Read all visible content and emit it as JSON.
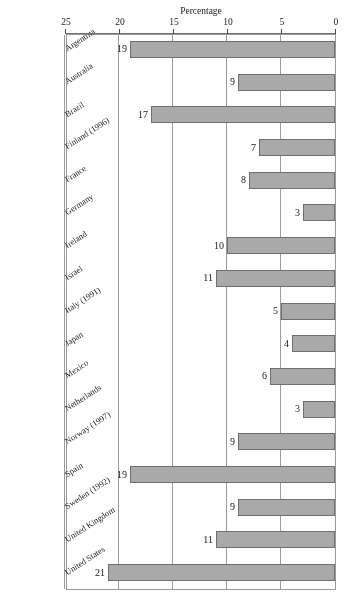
{
  "chart_data": {
    "type": "bar",
    "orientation": "horizontal",
    "title": "",
    "xlabel": "Percentage",
    "ylabel": "",
    "xlim": [
      0,
      25
    ],
    "xticks": [
      0,
      5,
      10,
      15,
      20,
      25
    ],
    "grid": true,
    "legend": null,
    "categories": [
      "United States",
      "United Kingdom",
      "Sweden (1992)",
      "Spain",
      "Norway (1997)",
      "Netherlands",
      "Mexico",
      "Japan",
      "Italy (1991)",
      "Israel",
      "Ireland",
      "Germany",
      "France",
      "Finland (1996)",
      "Brazil",
      "Australia",
      "Argentina"
    ],
    "values": [
      21,
      11,
      9,
      19,
      9,
      3,
      6,
      4,
      5,
      11,
      10,
      3,
      8,
      7,
      17,
      9,
      19
    ],
    "value_labels": [
      "21",
      "11",
      "9",
      "19",
      "9",
      "3",
      "6",
      "4",
      "5",
      "11",
      "10",
      "3",
      "8",
      "7",
      "17",
      "9",
      "19"
    ]
  },
  "axis": {
    "value_axis_title": "Percentage",
    "tick_labels": [
      "25",
      "20",
      "15",
      "10",
      "5",
      "0"
    ]
  },
  "colors": {
    "bar_fill": "#a9a9a9",
    "bar_border": "#6e6e6e",
    "grid": "#9b9b9b",
    "text": "#1c1c1c",
    "background": "#ffffff"
  }
}
